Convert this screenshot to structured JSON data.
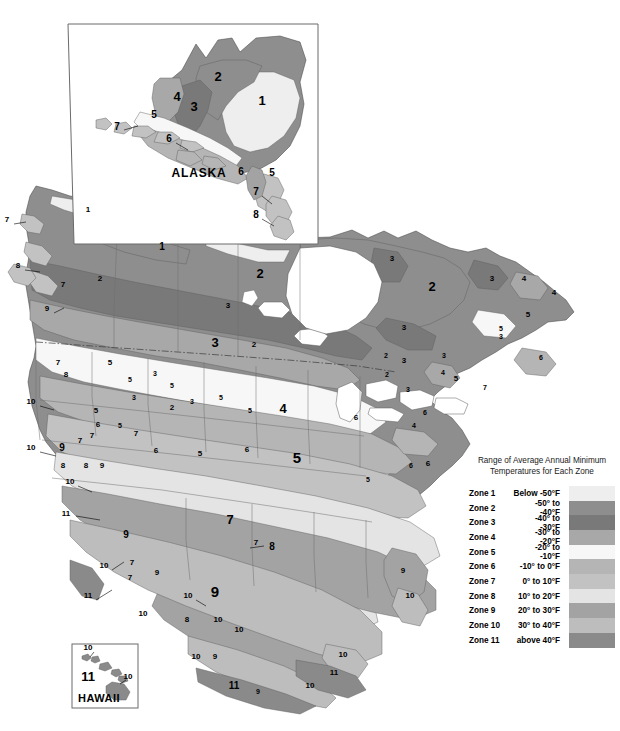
{
  "document": {
    "kind": "plant-hardiness-zone-map",
    "region_title": "North America"
  },
  "insets": [
    {
      "id": "alaska",
      "title": "ALASKA"
    },
    {
      "id": "hawaii",
      "title": "HAWAII"
    }
  ],
  "legend": {
    "title": "Range of Average Annual Minimum\nTemperatures for Each Zone",
    "rows": [
      {
        "zone": "Zone 1",
        "temp": "Below -50°F",
        "color": "#eeeeee"
      },
      {
        "zone": "Zone 2",
        "temp": "-50° to -40°F",
        "color": "#8e8e8e"
      },
      {
        "zone": "Zone 3",
        "temp": "-40° to -30°F",
        "color": "#797979"
      },
      {
        "zone": "Zone 4",
        "temp": "-30° to -20°F",
        "color": "#a8a8a8"
      },
      {
        "zone": "Zone 5",
        "temp": "-20° to -10°F",
        "color": "#f7f7f7"
      },
      {
        "zone": "Zone 6",
        "temp": "-10° to 0°F",
        "color": "#b5b5b5"
      },
      {
        "zone": "Zone 7",
        "temp": "0° to 10°F",
        "color": "#c2c2c2"
      },
      {
        "zone": "Zone 8",
        "temp": "10° to 20°F",
        "color": "#e4e4e4"
      },
      {
        "zone": "Zone 9",
        "temp": "20° to 30°F",
        "color": "#a3a3a3"
      },
      {
        "zone": "Zone 10",
        "temp": "30° to 40°F",
        "color": "#bdbdbd"
      },
      {
        "zone": "Zone 11",
        "temp": "above 40°F",
        "color": "#8a8a8a"
      }
    ]
  },
  "chart_data": {
    "type": "map",
    "legend_title": "Range of Average Annual Minimum Temperatures for Each Zone",
    "zones": [
      {
        "zone": 1,
        "label": "Zone 1",
        "temperature_range": "Below -50°F",
        "min_f": null,
        "max_f": -50,
        "color": "#eeeeee"
      },
      {
        "zone": 2,
        "label": "Zone 2",
        "temperature_range": "-50° to -40°F",
        "min_f": -50,
        "max_f": -40,
        "color": "#8e8e8e"
      },
      {
        "zone": 3,
        "label": "Zone 3",
        "temperature_range": "-40° to -30°F",
        "min_f": -40,
        "max_f": -30,
        "color": "#797979"
      },
      {
        "zone": 4,
        "label": "Zone 4",
        "temperature_range": "-30° to -20°F",
        "min_f": -30,
        "max_f": -20,
        "color": "#a8a8a8"
      },
      {
        "zone": 5,
        "label": "Zone 5",
        "temperature_range": "-20° to -10°F",
        "min_f": -20,
        "max_f": -10,
        "color": "#f7f7f7"
      },
      {
        "zone": 6,
        "label": "Zone 6",
        "temperature_range": "-10° to 0°F",
        "min_f": -10,
        "max_f": 0,
        "color": "#b5b5b5"
      },
      {
        "zone": 7,
        "label": "Zone 7",
        "temperature_range": "0° to 10°F",
        "min_f": 0,
        "max_f": 10,
        "color": "#c2c2c2"
      },
      {
        "zone": 8,
        "label": "Zone 8",
        "temperature_range": "10° to 20°F",
        "min_f": 10,
        "max_f": 20,
        "color": "#e4e4e4"
      },
      {
        "zone": 9,
        "label": "Zone 9",
        "temperature_range": "20° to 30°F",
        "min_f": 20,
        "max_f": 30,
        "color": "#a3a3a3"
      },
      {
        "zone": 10,
        "label": "Zone 10",
        "temperature_range": "30° to 40°F",
        "min_f": 30,
        "max_f": 40,
        "color": "#bdbdbd"
      },
      {
        "zone": 11,
        "label": "Zone 11",
        "temperature_range": "above 40°F",
        "min_f": 40,
        "max_f": null,
        "color": "#8a8a8a"
      }
    ],
    "insets": [
      "ALASKA",
      "HAWAII"
    ],
    "map_zone_labels": {
      "alaska": [
        "1",
        "2",
        "3",
        "4",
        "5",
        "6",
        "7",
        "5",
        "6",
        "7",
        "8"
      ],
      "hawaii": [
        "10",
        "11",
        "10"
      ],
      "mainland": [
        "1",
        "1",
        "2",
        "2",
        "2",
        "2",
        "3",
        "3",
        "3",
        "3",
        "3",
        "3",
        "3",
        "3",
        "4",
        "4",
        "4",
        "4",
        "5",
        "5",
        "5",
        "5",
        "5",
        "5",
        "5",
        "5",
        "6",
        "6",
        "6",
        "6",
        "6",
        "7",
        "7",
        "7",
        "7",
        "7",
        "7",
        "7",
        "8",
        "8",
        "8",
        "8",
        "8",
        "9",
        "9",
        "9",
        "9",
        "9",
        "9",
        "10",
        "10",
        "10",
        "10",
        "10",
        "10",
        "10",
        "11",
        "11",
        "11",
        "11"
      ]
    }
  },
  "map_labels": {
    "alaska": [
      {
        "t": "1",
        "x": 262,
        "y": 105,
        "size": "z-lg"
      },
      {
        "t": "2",
        "x": 218,
        "y": 81,
        "size": "z-lg"
      },
      {
        "t": "3",
        "x": 194,
        "y": 111,
        "size": "z-lg"
      },
      {
        "t": "4",
        "x": 177,
        "y": 101,
        "size": "z-lg"
      },
      {
        "t": "5",
        "x": 154,
        "y": 118,
        "size": "z-md"
      },
      {
        "t": "6",
        "x": 169,
        "y": 142,
        "size": "z-md"
      },
      {
        "t": "7",
        "x": 117,
        "y": 130,
        "size": "z-md"
      },
      {
        "t": "6",
        "x": 241,
        "y": 175,
        "size": "z-md"
      },
      {
        "t": "5",
        "x": 272,
        "y": 176,
        "size": "z-md"
      },
      {
        "t": "7",
        "x": 256,
        "y": 195,
        "size": "z-md"
      },
      {
        "t": "8",
        "x": 256,
        "y": 218,
        "size": "z-md"
      }
    ],
    "hawaii": [
      {
        "t": "10",
        "x": 88,
        "y": 650,
        "size": "z-sm"
      },
      {
        "t": "11",
        "x": 88,
        "y": 681,
        "size": "z-lg"
      },
      {
        "t": "10",
        "x": 128,
        "y": 679,
        "size": "z-sm"
      }
    ],
    "mainland": [
      {
        "t": "7",
        "x": 7,
        "y": 222,
        "size": "z-sm"
      },
      {
        "t": "1",
        "x": 88,
        "y": 212,
        "size": "z-sm"
      },
      {
        "t": "8",
        "x": 18,
        "y": 268,
        "size": "z-sm"
      },
      {
        "t": "2",
        "x": 100,
        "y": 281,
        "size": "z-sm"
      },
      {
        "t": "7",
        "x": 63,
        "y": 287,
        "size": "z-sm"
      },
      {
        "t": "9",
        "x": 47,
        "y": 311,
        "size": "z-sm"
      },
      {
        "t": "1",
        "x": 162,
        "y": 250,
        "size": "z-md"
      },
      {
        "t": "2",
        "x": 260,
        "y": 278,
        "size": "z-lg"
      },
      {
        "t": "3",
        "x": 228,
        "y": 308,
        "size": "z-sm"
      },
      {
        "t": "3",
        "x": 392,
        "y": 261,
        "size": "z-sm"
      },
      {
        "t": "2",
        "x": 432,
        "y": 291,
        "size": "z-lg"
      },
      {
        "t": "3",
        "x": 404,
        "y": 330,
        "size": "z-sm"
      },
      {
        "t": "3",
        "x": 492,
        "y": 281,
        "size": "z-sm"
      },
      {
        "t": "4",
        "x": 524,
        "y": 281,
        "size": "z-sm"
      },
      {
        "t": "4",
        "x": 554,
        "y": 295,
        "size": "z-sm"
      },
      {
        "t": "5",
        "x": 528,
        "y": 317,
        "size": "z-sm"
      },
      {
        "t": "5",
        "x": 501,
        "y": 331,
        "size": "z-xs"
      },
      {
        "t": "3",
        "x": 501,
        "y": 339,
        "size": "z-xs"
      },
      {
        "t": "6",
        "x": 541,
        "y": 360,
        "size": "z-xs"
      },
      {
        "t": "3",
        "x": 215,
        "y": 347,
        "size": "z-lg"
      },
      {
        "t": "2",
        "x": 254,
        "y": 347,
        "size": "z-sm"
      },
      {
        "t": "2",
        "x": 386,
        "y": 358,
        "size": "z-xs"
      },
      {
        "t": "3",
        "x": 404,
        "y": 363,
        "size": "z-sm"
      },
      {
        "t": "2",
        "x": 387,
        "y": 377,
        "size": "z-xs"
      },
      {
        "t": "3",
        "x": 444,
        "y": 358,
        "size": "z-xs"
      },
      {
        "t": "4",
        "x": 443,
        "y": 375,
        "size": "z-xs"
      },
      {
        "t": "5",
        "x": 456,
        "y": 381,
        "size": "z-sm"
      },
      {
        "t": "3",
        "x": 408,
        "y": 392,
        "size": "z-xs"
      },
      {
        "t": "7",
        "x": 485,
        "y": 390,
        "size": "z-xs"
      },
      {
        "t": "5",
        "x": 110,
        "y": 365,
        "size": "z-sm"
      },
      {
        "t": "7",
        "x": 58,
        "y": 365,
        "size": "z-sm"
      },
      {
        "t": "8",
        "x": 66,
        "y": 377,
        "size": "z-sm"
      },
      {
        "t": "5",
        "x": 130,
        "y": 382,
        "size": "z-xs"
      },
      {
        "t": "3",
        "x": 155,
        "y": 376,
        "size": "z-xs"
      },
      {
        "t": "5",
        "x": 172,
        "y": 388,
        "size": "z-xs"
      },
      {
        "t": "3",
        "x": 134,
        "y": 400,
        "size": "z-xs"
      },
      {
        "t": "2",
        "x": 172,
        "y": 410,
        "size": "z-sm"
      },
      {
        "t": "3",
        "x": 192,
        "y": 404,
        "size": "z-xs"
      },
      {
        "t": "5",
        "x": 221,
        "y": 400,
        "size": "z-xs"
      },
      {
        "t": "5",
        "x": 250,
        "y": 413,
        "size": "z-xs"
      },
      {
        "t": "4",
        "x": 283,
        "y": 413,
        "size": "z-lg"
      },
      {
        "t": "6",
        "x": 356,
        "y": 420,
        "size": "z-sm"
      },
      {
        "t": "6",
        "x": 425,
        "y": 415,
        "size": "z-xs"
      },
      {
        "t": "4",
        "x": 414,
        "y": 428,
        "size": "z-xs"
      },
      {
        "t": "10",
        "x": 31,
        "y": 404,
        "size": "z-sm"
      },
      {
        "t": "5",
        "x": 96,
        "y": 413,
        "size": "z-sm"
      },
      {
        "t": "6",
        "x": 98,
        "y": 427,
        "size": "z-sm"
      },
      {
        "t": "7",
        "x": 92,
        "y": 438,
        "size": "z-sm"
      },
      {
        "t": "7",
        "x": 136,
        "y": 436,
        "size": "z-sm"
      },
      {
        "t": "5",
        "x": 120,
        "y": 428,
        "size": "z-xs"
      },
      {
        "t": "7",
        "x": 80,
        "y": 443,
        "size": "z-sm"
      },
      {
        "t": "10",
        "x": 31,
        "y": 450,
        "size": "z-sm"
      },
      {
        "t": "9",
        "x": 62,
        "y": 451,
        "size": "z-md"
      },
      {
        "t": "8",
        "x": 63,
        "y": 468,
        "size": "z-sm"
      },
      {
        "t": "8",
        "x": 86,
        "y": 468,
        "size": "z-sm"
      },
      {
        "t": "9",
        "x": 102,
        "y": 468,
        "size": "z-sm"
      },
      {
        "t": "6",
        "x": 156,
        "y": 453,
        "size": "z-sm"
      },
      {
        "t": "5",
        "x": 200,
        "y": 456,
        "size": "z-sm"
      },
      {
        "t": "5",
        "x": 297,
        "y": 463,
        "size": "z-xl"
      },
      {
        "t": "6",
        "x": 247,
        "y": 452,
        "size": "z-sm"
      },
      {
        "t": "5",
        "x": 368,
        "y": 482,
        "size": "z-xs"
      },
      {
        "t": "6",
        "x": 428,
        "y": 466,
        "size": "z-sm"
      },
      {
        "t": "10",
        "x": 70,
        "y": 484,
        "size": "z-sm"
      },
      {
        "t": "11",
        "x": 66,
        "y": 516,
        "size": "z-sm"
      },
      {
        "t": "7",
        "x": 230,
        "y": 524,
        "size": "z-lg"
      },
      {
        "t": "7",
        "x": 256,
        "y": 545,
        "size": "z-sm"
      },
      {
        "t": "8",
        "x": 272,
        "y": 550,
        "size": "z-md"
      },
      {
        "t": "9",
        "x": 126,
        "y": 538,
        "size": "z-md"
      },
      {
        "t": "7",
        "x": 132,
        "y": 565,
        "size": "z-sm"
      },
      {
        "t": "7",
        "x": 130,
        "y": 580,
        "size": "z-sm"
      },
      {
        "t": "9",
        "x": 157,
        "y": 575,
        "size": "z-sm"
      },
      {
        "t": "9",
        "x": 215,
        "y": 597,
        "size": "z-xl"
      },
      {
        "t": "10",
        "x": 188,
        "y": 598,
        "size": "z-sm"
      },
      {
        "t": "10",
        "x": 104,
        "y": 568,
        "size": "z-sm"
      },
      {
        "t": "11",
        "x": 88,
        "y": 598,
        "size": "z-sm"
      },
      {
        "t": "10",
        "x": 143,
        "y": 616,
        "size": "z-sm"
      },
      {
        "t": "8",
        "x": 187,
        "y": 622,
        "size": "z-sm"
      },
      {
        "t": "10",
        "x": 218,
        "y": 622,
        "size": "z-sm"
      },
      {
        "t": "10",
        "x": 239,
        "y": 632,
        "size": "z-sm"
      },
      {
        "t": "10",
        "x": 196,
        "y": 659,
        "size": "z-sm"
      },
      {
        "t": "9",
        "x": 215,
        "y": 659,
        "size": "z-sm"
      },
      {
        "t": "11",
        "x": 234,
        "y": 689,
        "size": "z-md"
      },
      {
        "t": "9",
        "x": 258,
        "y": 694,
        "size": "z-xs"
      },
      {
        "t": "10",
        "x": 310,
        "y": 688,
        "size": "z-sm"
      },
      {
        "t": "10",
        "x": 343,
        "y": 657,
        "size": "z-sm"
      },
      {
        "t": "11",
        "x": 334,
        "y": 675,
        "size": "z-sm"
      },
      {
        "t": "9",
        "x": 403,
        "y": 573,
        "size": "z-sm"
      },
      {
        "t": "10",
        "x": 410,
        "y": 598,
        "size": "z-sm"
      },
      {
        "t": "6",
        "x": 411,
        "y": 468,
        "size": "z-xs"
      }
    ]
  }
}
